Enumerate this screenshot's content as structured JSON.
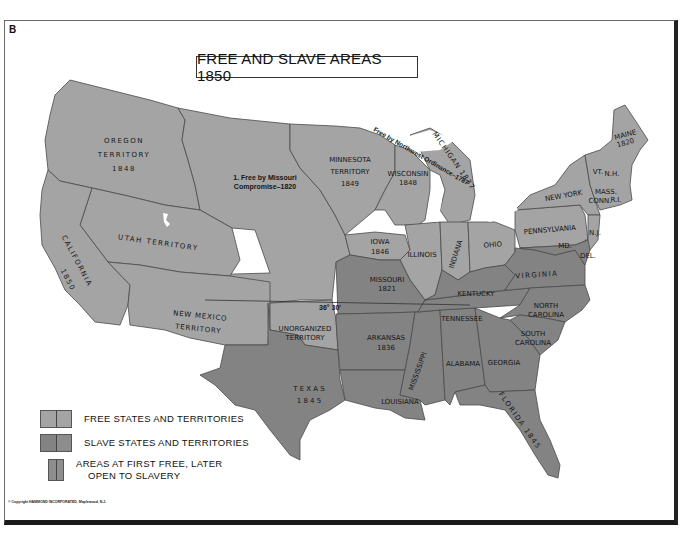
{
  "plate_letter": "B",
  "title": "FREE AND SLAVE AREAS 1850",
  "colors": {
    "free": "#a4a4a4",
    "slave": "#838383",
    "first_free_later_slavery": "#8e8e8e",
    "border": "#4a4a4a",
    "water": "#ffffff"
  },
  "labels": {
    "oregon_1": "OREGON",
    "oregon_2": "TERRITORY",
    "oregon_3": "1848",
    "missouri_compromise_1": "1. Free by Missouri",
    "missouri_compromise_2": "Compromise–1820",
    "minnesota_1": "MINNESOTA",
    "minnesota_2": "TERRITORY",
    "minnesota_3": "1849",
    "wisconsin_1": "WISCONSIN",
    "wisconsin_2": "1848",
    "northwest_ordinance": "Free by Northwest Ordinance–1787",
    "michigan": "MICHIGAN 1837",
    "maine_1": "MAINE",
    "maine_2": "1820",
    "vermont": "VT.",
    "new_hampshire": "N.H.",
    "massachusetts": "MASS.",
    "connecticut": "CONN.",
    "rhode_island": "R.I.",
    "new_york": "NEW YORK",
    "pennsylvania": "PENNSYLVANIA",
    "new_jersey": "N.J.",
    "maryland": "MD.",
    "delaware": "DEL.",
    "utah": "UTAH TERRITORY",
    "california_1": "CALIFORNIA",
    "california_2": "1850",
    "new_mexico_1": "NEW MEXICO",
    "new_mexico_2": "TERRITORY",
    "iowa_1": "IOWA",
    "iowa_2": "1846",
    "illinois": "ILLINOIS",
    "indiana": "INDIANA",
    "ohio": "OHIO",
    "missouri_1": "MISSOURI",
    "missouri_2": "1821",
    "kentucky": "KENTUCKY",
    "virginia": "VIRGINIA",
    "parallel": "36° 30'",
    "unorganized_1": "UNORGANIZED",
    "unorganized_2": "TERRITORY",
    "arkansas_1": "ARKANSAS",
    "arkansas_2": "1836",
    "tennessee": "TENNESSEE",
    "north_carolina_1": "NORTH",
    "north_carolina_2": "CAROLINA",
    "south_carolina_1": "SOUTH",
    "south_carolina_2": "CAROLINA",
    "mississippi": "MISSISSIPPI",
    "alabama": "ALABAMA",
    "georgia": "GEORGIA",
    "texas_1": "T E X A S",
    "texas_2": "1 8 4 5",
    "louisiana": "LOUISIANA",
    "florida": "FLORIDA 1845"
  },
  "legend": {
    "items": [
      {
        "label": "FREE STATES AND TERRITORIES"
      },
      {
        "label": "SLAVE STATES AND TERRITORIES"
      },
      {
        "label_1": "AREAS AT FIRST FREE, LATER",
        "label_2": "OPEN TO SLAVERY"
      }
    ]
  },
  "copyright": "© Copyright HAMMOND INCORPORATED, Maplewood, N.J."
}
